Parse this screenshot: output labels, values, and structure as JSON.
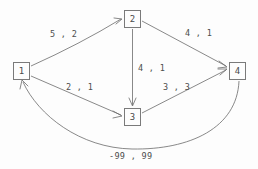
{
  "diagram": {
    "background_color": "#fdfdfd",
    "stroke_color": "#6b6b6b",
    "text_color": "#4d4d4d"
  },
  "nodes": [
    {
      "id": "1",
      "label": "1",
      "x": 13,
      "y": 62
    },
    {
      "id": "2",
      "label": "2",
      "x": 124,
      "y": 10
    },
    {
      "id": "3",
      "label": "3",
      "x": 124,
      "y": 108
    },
    {
      "id": "4",
      "label": "4",
      "x": 229,
      "y": 62
    }
  ],
  "edges": [
    {
      "id": "e1-2",
      "from": "1",
      "to": "2",
      "label": "5 , 2",
      "label_x": 50,
      "label_y": 30,
      "shape": "curve"
    },
    {
      "id": "e2-4",
      "from": "2",
      "to": "4",
      "label": "4 , 1",
      "label_x": 185,
      "label_y": 29,
      "shape": "line"
    },
    {
      "id": "e2-3",
      "from": "2",
      "to": "3",
      "label": "4 , 1",
      "label_x": 138,
      "label_y": 64,
      "shape": "line"
    },
    {
      "id": "e1-3",
      "from": "1",
      "to": "3",
      "label": "2 , 1",
      "label_x": 66,
      "label_y": 83,
      "shape": "line"
    },
    {
      "id": "e3-4",
      "from": "3",
      "to": "4",
      "label": "3 , 3",
      "label_x": 163,
      "label_y": 83,
      "shape": "line"
    },
    {
      "id": "e4-1",
      "from": "4",
      "to": "1",
      "label": "-99 , 99",
      "label_x": 109,
      "label_y": 152,
      "shape": "curve"
    }
  ]
}
